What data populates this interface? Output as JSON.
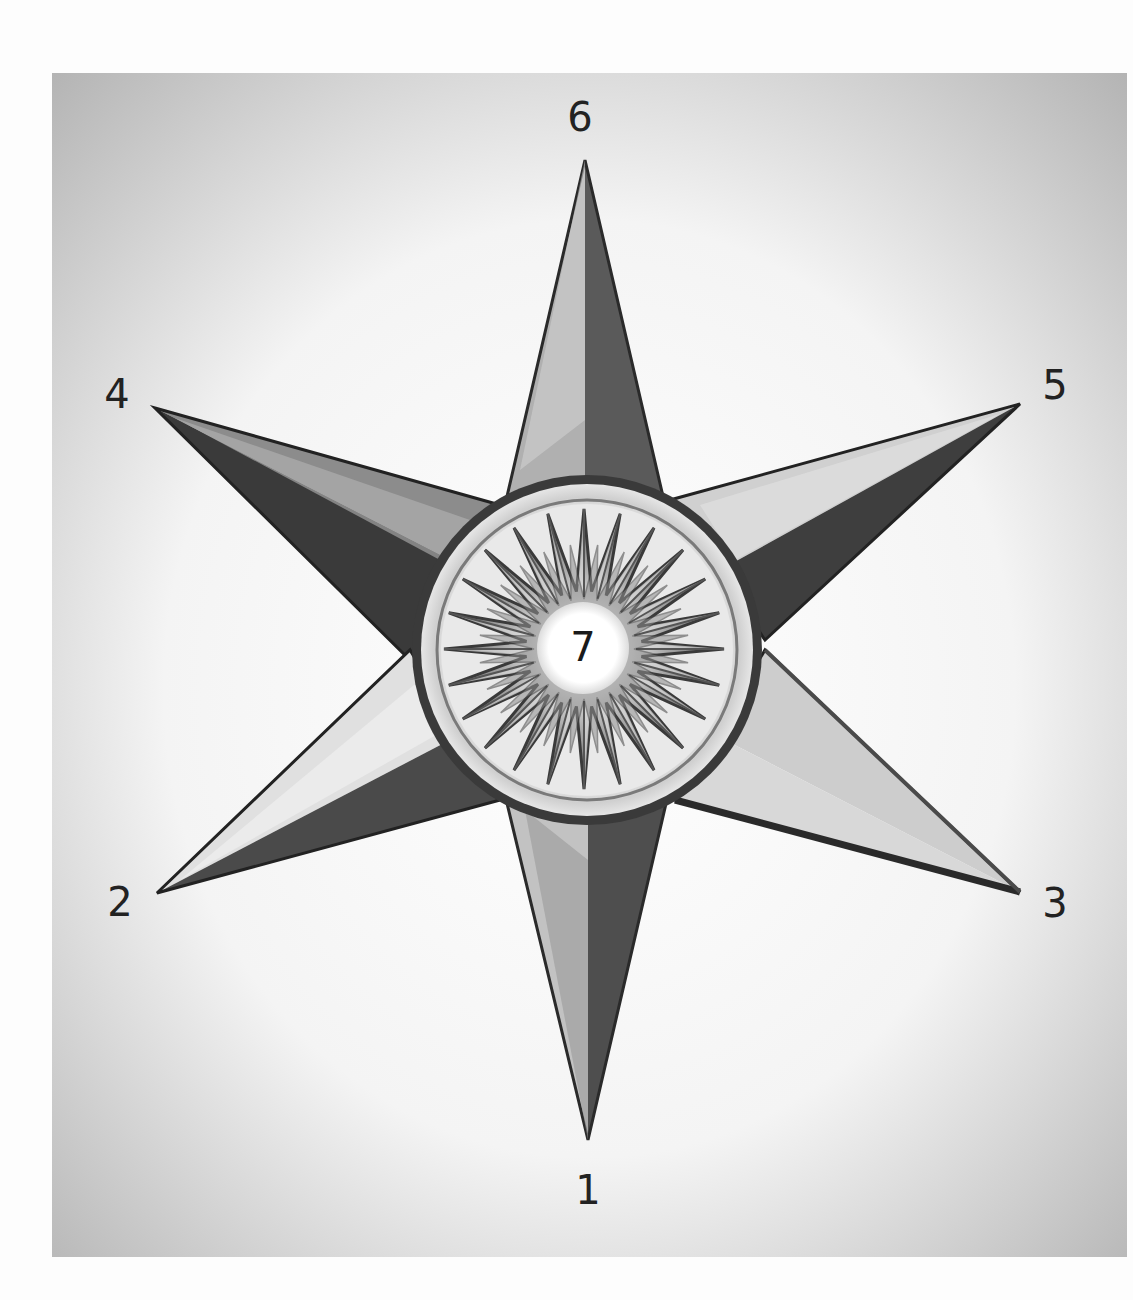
{
  "diagram": {
    "type": "six-pointed compass star",
    "colors": {
      "page_background": "#fdfdfd",
      "panel_gradient_edge": "#b8b8b8",
      "panel_gradient_center": "#ffffff",
      "arm_light": "#e4e4e4",
      "arm_mid": "#9a9a9a",
      "arm_dark": "#3a3a3a",
      "ring_dark": "#3c3c3c",
      "ring_light": "#e8e8e8",
      "hub_white": "#ffffff"
    },
    "points": [
      {
        "id": "1",
        "label": "1",
        "direction": "bottom"
      },
      {
        "id": "2",
        "label": "2",
        "direction": "lower-left"
      },
      {
        "id": "3",
        "label": "3",
        "direction": "lower-right"
      },
      {
        "id": "4",
        "label": "4",
        "direction": "upper-left"
      },
      {
        "id": "5",
        "label": "5",
        "direction": "upper-right"
      },
      {
        "id": "6",
        "label": "6",
        "direction": "top"
      }
    ],
    "center": {
      "id": "7",
      "label": "7"
    },
    "inner_rose_points": 24
  }
}
